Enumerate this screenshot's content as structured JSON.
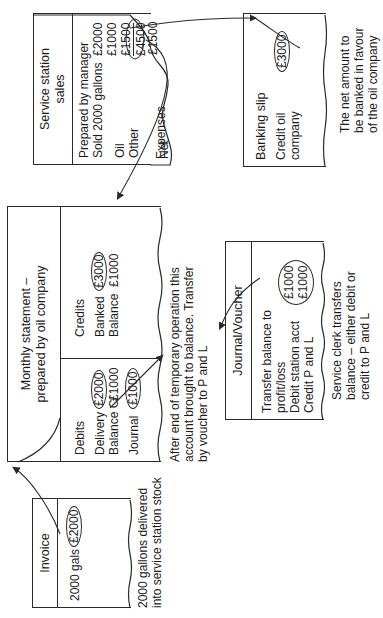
{
  "invoice": {
    "title": "Invoice",
    "line_label": "2000 gals",
    "amount": "£2000",
    "caption": [
      "2000 gallons delivered",
      "into service station stock"
    ]
  },
  "monthly_statement": {
    "title": [
      "Monthly statement –",
      "prepared by oil company"
    ],
    "debits": {
      "heading": "Debits",
      "rows": [
        {
          "label": "Delivery",
          "amount": "£2000"
        },
        {
          "label": "Balance C/",
          "amount": "£1000"
        },
        {
          "label": "Journal",
          "amount": "£1000"
        }
      ]
    },
    "credits": {
      "heading": "Credits",
      "rows": [
        {
          "label": "Banked",
          "amount": "£3000"
        },
        {
          "label": "Balance",
          "amount": "£1000"
        }
      ]
    },
    "caption": [
      "After end of temporary operation this",
      "account brought to balance. Transfer",
      "by voucher to P and L"
    ]
  },
  "journal_voucher": {
    "title": "Journal/Voucher",
    "lines": [
      "Transfer balance to",
      "profit/loss",
      "Debit station acct",
      "Credit P and L"
    ],
    "amounts": [
      "£1000",
      "£1000"
    ],
    "caption": [
      "Service clerk transfers",
      "balance – either debit or",
      "credit to P and L"
    ]
  },
  "service_station_sales": {
    "title": [
      "Service station",
      "sales"
    ],
    "lines": [
      "Prepared by manager",
      "Sold 2000 gallons"
    ],
    "gallons_amount": "£2000",
    "rows": [
      {
        "label": "Oil",
        "amount": "£1000"
      },
      {
        "label": "Other",
        "amount": "£1500"
      }
    ],
    "total": "£4500",
    "expenses": {
      "label": "Expenses",
      "amount": "£1500"
    },
    "net": {
      "label": "Net",
      "amount": "£3000"
    }
  },
  "banking_slip": {
    "title": "Banking slip",
    "lines": [
      "Credit oil",
      "company"
    ],
    "amount": "£3000",
    "caption": [
      "The net amount to",
      "be banked in favour",
      "of the oil company"
    ]
  }
}
